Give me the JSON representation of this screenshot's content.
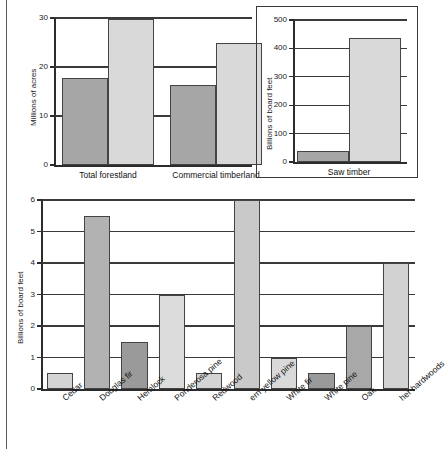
{
  "figure": {
    "background": "#ffffff",
    "colors": {
      "bar_dark": "#a6a6a6",
      "bar_light": "#d9d9d9",
      "bar_mid": "#b5b5b5",
      "bar_darker": "#949494",
      "bar_pale": "#dcdcdc",
      "axis": "#2c2c2c",
      "grid": "#3a3a3a"
    }
  },
  "chart_data": [
    {
      "id": "forestland-chart",
      "type": "bar",
      "title": "",
      "xlabel": "",
      "ylabel": "Millions of acres",
      "ylim": [
        0,
        30
      ],
      "yticks": [
        0,
        10,
        20,
        30
      ],
      "yticklabels": [
        "0",
        "10",
        "20",
        "30"
      ],
      "grid": true,
      "legend": "none",
      "categories": [
        "Total forestland",
        "Commercial timberland"
      ],
      "series": [
        {
          "name": "dark",
          "color": "#a6a6a6",
          "values": [
            17.7,
            16.4
          ]
        },
        {
          "name": "light",
          "color": "#d9d9d9",
          "values": [
            29.7,
            25.0
          ]
        }
      ]
    },
    {
      "id": "saw-timber-chart",
      "type": "bar",
      "title": "",
      "xlabel": "",
      "ylabel": "Billions of board feet",
      "ylim": [
        0,
        500
      ],
      "yticks": [
        0,
        100,
        200,
        300,
        400,
        500
      ],
      "yticklabels": [
        "0",
        "100",
        "200",
        "300",
        "400",
        "500"
      ],
      "grid": true,
      "legend": "none",
      "categories": [
        "Saw timber"
      ],
      "series": [
        {
          "name": "dark",
          "color": "#a6a6a6",
          "values": [
            40
          ]
        },
        {
          "name": "light",
          "color": "#d9d9d9",
          "values": [
            435
          ]
        }
      ]
    },
    {
      "id": "species-chart",
      "type": "bar",
      "title": "",
      "xlabel": "",
      "ylabel": "Billions of board feet",
      "ylim": [
        0,
        6
      ],
      "yticks": [
        0,
        1,
        2,
        3,
        4,
        5,
        6
      ],
      "yticklabels": [
        "0",
        "1",
        "2",
        "3",
        "4",
        "5",
        "6"
      ],
      "grid": true,
      "legend": "none",
      "categories": [
        "Cedar",
        "Douglas fir",
        "Hemlock",
        "Ponderosa pine",
        "Redwood",
        "ern yellow pine",
        "White fir",
        "White pine",
        "Oak",
        "her hardwoods"
      ],
      "values": [
        0.5,
        5.5,
        1.5,
        3.0,
        0.5,
        6.0,
        1.0,
        0.5,
        2.0,
        4.0
      ],
      "bar_colors": [
        "#d4d4d4",
        "#b2b2b2",
        "#9a9a9a",
        "#dcdcdc",
        "#d4d4d4",
        "#c9c9c9",
        "#d9d9d9",
        "#9a9a9a",
        "#a8a8a8",
        "#d2d2d2"
      ]
    }
  ]
}
